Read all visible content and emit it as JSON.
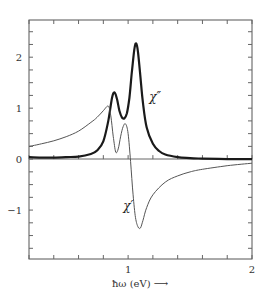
{
  "chart_data": {
    "type": "line",
    "title": "",
    "xlabel": "ħω (eV) ⟶",
    "ylabel": "",
    "xlim": [
      0.2,
      2.0
    ],
    "ylim": [
      -1.96,
      2.73
    ],
    "grid": false,
    "legend": "none (inline curve labels)",
    "x_ticks": [
      {
        "value": 1,
        "label": "1"
      },
      {
        "value": 2,
        "label": "2"
      }
    ],
    "x_minor_step": 0.2,
    "y_ticks": [
      {
        "value": 2,
        "label": "2"
      },
      {
        "value": 1,
        "label": "1"
      },
      {
        "value": 0,
        "label": "0"
      },
      {
        "value": -1,
        "label": "−1"
      }
    ],
    "y_minor_step": 0.25,
    "zero_line": true,
    "annotations": [
      {
        "text": "χ″",
        "x": 1.17,
        "y": 1.15,
        "target_series": "chi_imag"
      },
      {
        "text": "χ′",
        "x": 0.96,
        "y": -1.0,
        "target_series": "chi_real"
      }
    ],
    "series": [
      {
        "name": "χ″",
        "key": "chi_imag",
        "style": "thick",
        "x": [
          0.2,
          0.3,
          0.4,
          0.5,
          0.6,
          0.7,
          0.75,
          0.8,
          0.84,
          0.87,
          0.89,
          0.91,
          0.93,
          0.95,
          0.97,
          0.99,
          1.01,
          1.03,
          1.05,
          1.065,
          1.08,
          1.1,
          1.12,
          1.15,
          1.2,
          1.25,
          1.3,
          1.4,
          1.5,
          1.6,
          1.8,
          2.0
        ],
        "values": [
          0.04,
          0.03,
          0.03,
          0.04,
          0.05,
          0.1,
          0.17,
          0.35,
          0.75,
          1.2,
          1.31,
          1.18,
          0.95,
          0.82,
          0.8,
          0.9,
          1.2,
          1.7,
          2.15,
          2.27,
          2.1,
          1.6,
          1.1,
          0.62,
          0.3,
          0.16,
          0.09,
          0.04,
          0.02,
          0.01,
          0.0,
          0.0
        ]
      },
      {
        "name": "χ′",
        "key": "chi_real",
        "style": "thin",
        "x": [
          0.2,
          0.3,
          0.4,
          0.5,
          0.6,
          0.7,
          0.75,
          0.8,
          0.84,
          0.86,
          0.88,
          0.9,
          0.92,
          0.94,
          0.96,
          0.98,
          1.0,
          1.02,
          1.04,
          1.06,
          1.08,
          1.1,
          1.12,
          1.15,
          1.2,
          1.3,
          1.4,
          1.5,
          1.6,
          1.8,
          2.0
        ],
        "values": [
          0.25,
          0.3,
          0.36,
          0.44,
          0.55,
          0.72,
          0.82,
          0.95,
          1.04,
          0.85,
          0.45,
          0.14,
          0.2,
          0.45,
          0.64,
          0.69,
          0.5,
          -0.05,
          -0.7,
          -1.15,
          -1.33,
          -1.35,
          -1.2,
          -0.95,
          -0.7,
          -0.45,
          -0.33,
          -0.25,
          -0.2,
          -0.13,
          -0.08
        ]
      }
    ]
  }
}
